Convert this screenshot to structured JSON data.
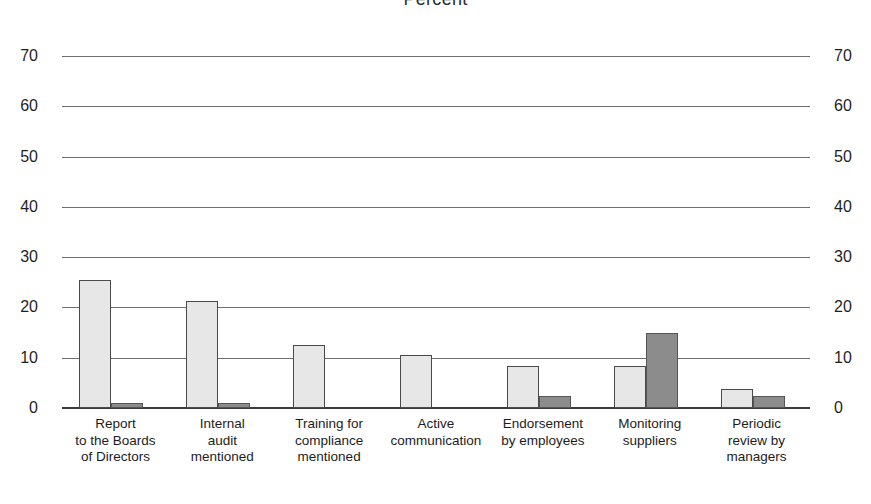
{
  "chart_data": {
    "type": "bar",
    "title": "Percent",
    "xlabel": "",
    "ylabel": "",
    "ylim": [
      0,
      70
    ],
    "yticks": [
      0,
      10,
      20,
      30,
      40,
      50,
      60,
      70
    ],
    "grid": true,
    "legend": "none",
    "axis_labels_both_sides": true,
    "categories": [
      "Report to the Boards of Directors",
      "Internal audit mentioned",
      "Training for compliance mentioned",
      "Active communication",
      "Endorsement by employees",
      "Monitoring suppliers",
      "Periodic review by managers"
    ],
    "category_lines": [
      [
        "Report",
        "to the Boards",
        "of Directors"
      ],
      [
        "Internal",
        "audit",
        "mentioned"
      ],
      [
        "Training for",
        "compliance",
        "mentioned"
      ],
      [
        "Active",
        "communication"
      ],
      [
        "Endorsement",
        "by employees"
      ],
      [
        "Monitoring",
        "suppliers"
      ],
      [
        "Periodic",
        "review by",
        "managers"
      ]
    ],
    "series": [
      {
        "name": "series-light",
        "color": "#e7e7e7",
        "values": [
          25.5,
          21.3,
          12.5,
          10.6,
          8.3,
          8.3,
          3.7
        ]
      },
      {
        "name": "series-dark",
        "color": "#8c8c8c",
        "values": [
          1.0,
          1.0,
          0,
          0,
          2.3,
          14.9,
          2.3
        ]
      }
    ]
  },
  "colors": {
    "series_light": "#e7e7e7",
    "series_dark": "#8c8c8c",
    "gridline": "#6e6e6e",
    "baseline": "#3a3a3a",
    "text": "#1c1c1c",
    "background": "#ffffff"
  },
  "axis": {
    "left_ticks": [
      "70",
      "60",
      "50",
      "40",
      "30",
      "20",
      "10",
      "0"
    ],
    "right_ticks": [
      "70",
      "60",
      "50",
      "40",
      "30",
      "20",
      "10",
      "0"
    ]
  }
}
